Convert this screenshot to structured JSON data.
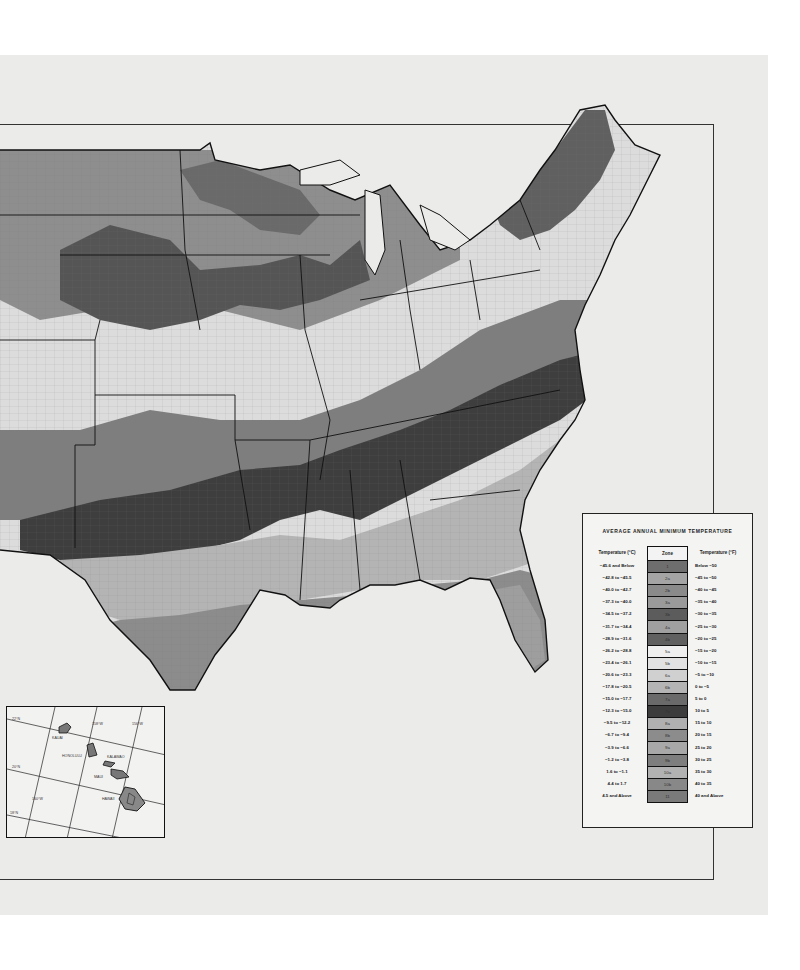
{
  "map": {
    "type": "plant hardiness zone map",
    "region": "Contiguous United States",
    "colors": {
      "page_background": "#ebebea",
      "frame_line": "#333333",
      "water": "#ebebea"
    }
  },
  "legend": {
    "title": "AVERAGE ANNUAL MINIMUM TEMPERATURE",
    "header_celsius": "Temperature (°C)",
    "header_zone": "Zone",
    "header_fahrenheit": "Temperature (°F)",
    "rows": [
      {
        "celsius": "−45.6  and Below",
        "zone": "1",
        "fahrenheit": "Below  −50",
        "color": "#6e6e6e"
      },
      {
        "celsius": "−42.8  to −45.5",
        "zone": "2a",
        "fahrenheit": "−45  to −50",
        "color": "#a4a4a4"
      },
      {
        "celsius": "−40.0  to −42.7",
        "zone": "2b",
        "fahrenheit": "−40  to −45",
        "color": "#8a8a8a"
      },
      {
        "celsius": "−37.3  to −40.0",
        "zone": "3a",
        "fahrenheit": "−35  to −40",
        "color": "#9a9a9a"
      },
      {
        "celsius": "−34.5  to −37.2",
        "zone": "3b",
        "fahrenheit": "−30  to −35",
        "color": "#5c5c5c"
      },
      {
        "celsius": "−31.7  to −34.4",
        "zone": "4a",
        "fahrenheit": "−25  to −30",
        "color": "#a0a0a0"
      },
      {
        "celsius": "−28.9  to −31.6",
        "zone": "4b",
        "fahrenheit": "−20  to −25",
        "color": "#606060"
      },
      {
        "celsius": "−26.2  to −28.8",
        "zone": "5a",
        "fahrenheit": "−15  to −20",
        "color": "#efefef"
      },
      {
        "celsius": "−23.4  to −26.1",
        "zone": "5b",
        "fahrenheit": "−10  to −15",
        "color": "#e2e2e2"
      },
      {
        "celsius": "−20.6  to −23.3",
        "zone": "6a",
        "fahrenheit": "−5  to −10",
        "color": "#d0d0d0"
      },
      {
        "celsius": "−17.8  to −20.5",
        "zone": "6b",
        "fahrenheit": "0  to  −5",
        "color": "#b4b4b4"
      },
      {
        "celsius": "−15.0  to −17.7",
        "zone": "7a",
        "fahrenheit": "5  to   0",
        "color": "#6a6a6a"
      },
      {
        "celsius": "−12.3  to −15.0",
        "zone": "7b",
        "fahrenheit": "10  to   5",
        "color": "#3c3c3c"
      },
      {
        "celsius": "−9.5  to −12.2",
        "zone": "8a",
        "fahrenheit": "15  to  10",
        "color": "#b0b0b0"
      },
      {
        "celsius": "−6.7  to  −9.4",
        "zone": "8b",
        "fahrenheit": "20  to  15",
        "color": "#8c8c8c"
      },
      {
        "celsius": "−3.9  to  −6.6",
        "zone": "9a",
        "fahrenheit": "25  to  20",
        "color": "#a8a8a8"
      },
      {
        "celsius": "−1.2  to  −3.8",
        "zone": "9b",
        "fahrenheit": "30  to  25",
        "color": "#7e7e7e"
      },
      {
        "celsius": "1.6  to  −1.1",
        "zone": "10a",
        "fahrenheit": "35  to  30",
        "color": "#b2b2b2"
      },
      {
        "celsius": "4.4  to   1.7",
        "zone": "10b",
        "fahrenheit": "40  to  35",
        "color": "#888888"
      },
      {
        "celsius": "4.5  and Above",
        "zone": "11",
        "fahrenheit": "40  and Above",
        "color": "#7a7a7a"
      }
    ]
  },
  "inset": {
    "name": "Hawaii inset",
    "places": [
      {
        "label": "KAUAI"
      },
      {
        "label": "HONOLULU"
      },
      {
        "label": "KALAWAO"
      },
      {
        "label": "MAUI"
      },
      {
        "label": "HAWAII"
      }
    ],
    "graticule": {
      "lat": [
        "22°N",
        "20°N",
        "18°N"
      ],
      "lon": [
        "160°W",
        "158°W",
        "156°W"
      ]
    }
  }
}
